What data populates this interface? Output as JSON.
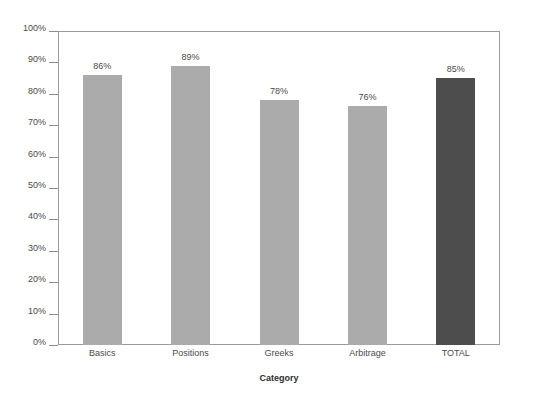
{
  "chart_data": {
    "type": "bar",
    "title": "",
    "xlabel": "Category",
    "ylabel": "",
    "categories": [
      "Basics",
      "Positions",
      "Greeks",
      "Arbitrage",
      "TOTAL"
    ],
    "values": [
      86,
      89,
      78,
      76,
      85
    ],
    "value_labels": [
      "86%",
      "89%",
      "78%",
      "76%",
      "85%"
    ],
    "ylim": [
      0,
      100
    ],
    "ytick_labels": [
      "0%",
      "10%",
      "20%",
      "30%",
      "40%",
      "50%",
      "60%",
      "70%",
      "80%",
      "90%",
      "100%"
    ],
    "ytick_values": [
      0,
      10,
      20,
      30,
      40,
      50,
      60,
      70,
      80,
      90,
      100
    ],
    "grid": false,
    "legend": "none",
    "bar_colors": [
      "#ababab",
      "#ababab",
      "#ababab",
      "#ababab",
      "#4d4d4d"
    ],
    "highlight_category": "TOTAL",
    "colors": {
      "bar_default": "#ababab",
      "bar_highlight": "#4d4d4d",
      "axis": "#9a9a9a",
      "tick": "#8d8d8d",
      "text": "#4a4a4a",
      "background": "#ffffff"
    }
  }
}
